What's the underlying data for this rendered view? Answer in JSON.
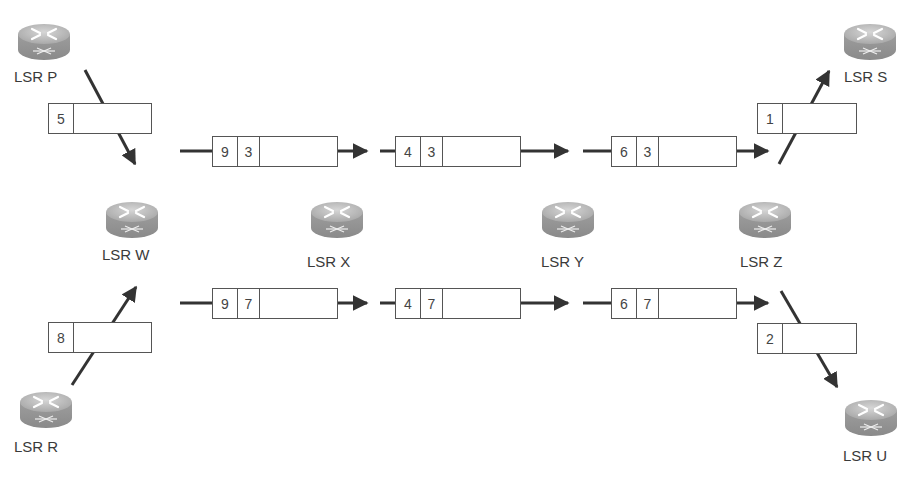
{
  "diagram": {
    "type": "MPLS label switching path",
    "colors": {
      "line": "#333333",
      "box_border": "#555555",
      "router_body": "#9a9a9a",
      "router_top": "#c4c4c4",
      "text": "#3a3a3a"
    }
  },
  "routers": [
    {
      "id": "P",
      "label": "LSR P",
      "x": 16,
      "y": 22,
      "lx": 14,
      "ly": 68
    },
    {
      "id": "S",
      "label": "LSR S",
      "x": 842,
      "y": 22,
      "lx": 844,
      "ly": 68
    },
    {
      "id": "W",
      "label": "LSR W",
      "x": 104,
      "y": 200,
      "lx": 102,
      "ly": 246
    },
    {
      "id": "X",
      "label": "LSR X",
      "x": 309,
      "y": 200,
      "lx": 307,
      "ly": 253
    },
    {
      "id": "Y",
      "label": "LSR Y",
      "x": 540,
      "y": 200,
      "lx": 541,
      "ly": 253
    },
    {
      "id": "Z",
      "label": "LSR Z",
      "x": 737,
      "y": 200,
      "lx": 740,
      "ly": 253
    },
    {
      "id": "R",
      "label": "LSR R",
      "x": 18,
      "y": 390,
      "lx": 14,
      "ly": 438
    },
    {
      "id": "U",
      "label": "LSR U",
      "x": 843,
      "y": 398,
      "lx": 843,
      "ly": 447
    }
  ],
  "packets": [
    {
      "id": "p-ingress-top",
      "labels": [
        "5"
      ],
      "x": 48,
      "y": 103,
      "w": 104
    },
    {
      "id": "p-w-x-top",
      "labels": [
        "9",
        "3"
      ],
      "x": 212,
      "y": 136,
      "w": 126
    },
    {
      "id": "p-x-y-top",
      "labels": [
        "4",
        "3"
      ],
      "x": 395,
      "y": 136,
      "w": 126
    },
    {
      "id": "p-y-z-top",
      "labels": [
        "6",
        "3"
      ],
      "x": 611,
      "y": 136,
      "w": 126
    },
    {
      "id": "p-egress-top",
      "labels": [
        "1"
      ],
      "x": 757,
      "y": 103,
      "w": 100
    },
    {
      "id": "p-ingress-bottom",
      "labels": [
        "8"
      ],
      "x": 48,
      "y": 322,
      "w": 104
    },
    {
      "id": "p-w-x-bottom",
      "labels": [
        "9",
        "7"
      ],
      "x": 212,
      "y": 288,
      "w": 126
    },
    {
      "id": "p-x-y-bottom",
      "labels": [
        "4",
        "7"
      ],
      "x": 395,
      "y": 288,
      "w": 126
    },
    {
      "id": "p-y-z-bottom",
      "labels": [
        "6",
        "7"
      ],
      "x": 611,
      "y": 288,
      "w": 126
    },
    {
      "id": "p-egress-bottom",
      "labels": [
        "2"
      ],
      "x": 757,
      "y": 323,
      "w": 100
    }
  ],
  "arrows": [
    {
      "id": "a-p-w",
      "x1": 85,
      "y1": 70,
      "x2": 135,
      "y2": 164
    },
    {
      "id": "a-top-1",
      "x1": 180,
      "y1": 151,
      "x2": 367,
      "y2": 151
    },
    {
      "id": "a-top-2",
      "x1": 380,
      "y1": 151,
      "x2": 568,
      "y2": 151
    },
    {
      "id": "a-top-3",
      "x1": 583,
      "y1": 151,
      "x2": 768,
      "y2": 151
    },
    {
      "id": "a-z-s",
      "x1": 779,
      "y1": 164,
      "x2": 829,
      "y2": 71
    },
    {
      "id": "a-r-w",
      "x1": 72,
      "y1": 385,
      "x2": 136,
      "y2": 287
    },
    {
      "id": "a-bot-1",
      "x1": 180,
      "y1": 303,
      "x2": 367,
      "y2": 303
    },
    {
      "id": "a-bot-2",
      "x1": 380,
      "y1": 303,
      "x2": 568,
      "y2": 303
    },
    {
      "id": "a-bot-3",
      "x1": 583,
      "y1": 303,
      "x2": 768,
      "y2": 303
    },
    {
      "id": "a-z-u",
      "x1": 781,
      "y1": 291,
      "x2": 837,
      "y2": 387
    }
  ]
}
